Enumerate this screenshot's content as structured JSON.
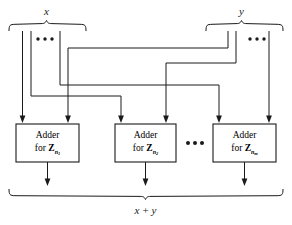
{
  "figure": {
    "top_left_label": "x",
    "top_right_label": "y",
    "bottom_label_left": "x",
    "bottom_label_op": "+",
    "bottom_label_right": "y",
    "ellipsis": "•••",
    "colors": {
      "line": "#1a1a1a",
      "box_fill": "#ffffff",
      "background": "#ffffff",
      "text": "#000000"
    },
    "adders": [
      {
        "id": "adder-1",
        "line1": "Adder",
        "line2_prefix": "for",
        "modulus_symbol": "Z",
        "modulus_sub": "n",
        "modulus_subsub": "1"
      },
      {
        "id": "adder-2",
        "line1": "Adder",
        "line2_prefix": "for",
        "modulus_symbol": "Z",
        "modulus_sub": "n",
        "modulus_subsub": "2"
      },
      {
        "id": "adder-m",
        "line1": "Adder",
        "line2_prefix": "for",
        "modulus_symbol": "Z",
        "modulus_sub": "n",
        "modulus_subsub": "m"
      }
    ],
    "ellipsis_groups": [
      {
        "id": "ellipsis-x-inputs",
        "text": "•••"
      },
      {
        "id": "ellipsis-y-inputs",
        "text": "•••"
      },
      {
        "id": "ellipsis-adders",
        "text": "•••"
      }
    ]
  }
}
